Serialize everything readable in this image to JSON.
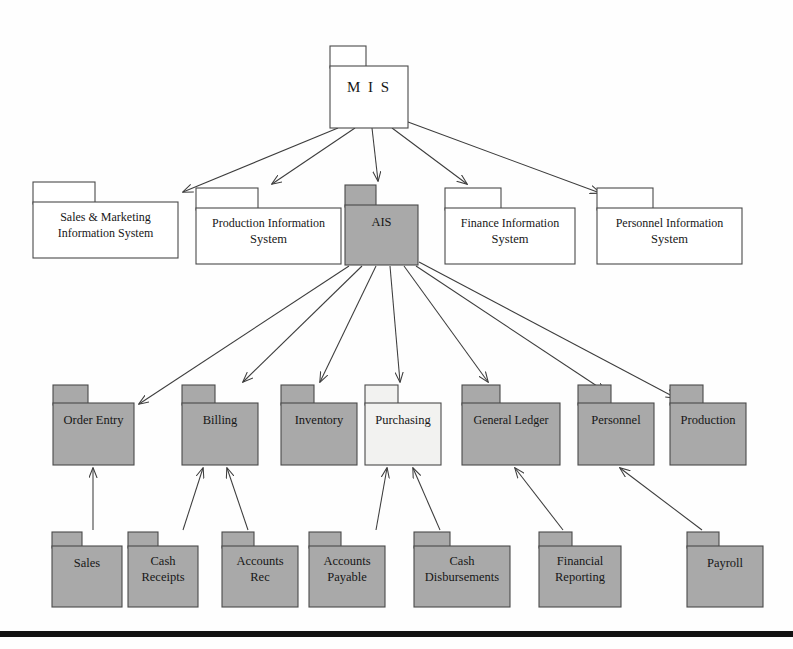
{
  "diagram": {
    "colors": {
      "shaded_fill": "#a9a9a9",
      "light_fill": "#f2f2f0",
      "white_fill": "#ffffff",
      "outline": "#4a4a4a",
      "connector": "#3c3c3c",
      "rule": "#121212",
      "text": "#171717"
    },
    "levels": [
      {
        "id": "level-1",
        "name": "root",
        "nodes": [
          {
            "id": "mis",
            "label": "M I S",
            "lines": [
              "M I S"
            ],
            "fill": "white_fill",
            "x": 330,
            "y": 46,
            "w": 78,
            "h": 82,
            "tab_w": 36,
            "tab_h": 20
          }
        ]
      },
      {
        "id": "level-2",
        "name": "information-systems",
        "nodes": [
          {
            "id": "sales-marketing-is",
            "label": "Sales & Marketing Information System",
            "lines": [
              "Sales & Marketing",
              "Information System"
            ],
            "fill": "white_fill",
            "x": 33,
            "y": 182,
            "w": 145,
            "h": 76,
            "tab_w": 62,
            "tab_h": 20
          },
          {
            "id": "production-is",
            "label": "Production Information System",
            "lines": [
              "Production Information",
              "System"
            ],
            "fill": "white_fill",
            "x": 196,
            "y": 188,
            "w": 145,
            "h": 76,
            "tab_w": 62,
            "tab_h": 20
          },
          {
            "id": "ais",
            "label": "AIS",
            "lines": [
              "AIS"
            ],
            "fill": "shaded_fill",
            "x": 345,
            "y": 185,
            "w": 73,
            "h": 80,
            "tab_w": 31,
            "tab_h": 20
          },
          {
            "id": "finance-is",
            "label": "Finance Information System",
            "lines": [
              "Finance Information",
              "System"
            ],
            "fill": "white_fill",
            "x": 445,
            "y": 188,
            "w": 130,
            "h": 76,
            "tab_w": 56,
            "tab_h": 20
          },
          {
            "id": "personnel-is",
            "label": "Personnel Information System",
            "lines": [
              "Personnel Information",
              "System"
            ],
            "fill": "white_fill",
            "x": 597,
            "y": 188,
            "w": 145,
            "h": 76,
            "tab_w": 56,
            "tab_h": 20
          }
        ]
      },
      {
        "id": "level-3",
        "name": "ais-subsystems",
        "nodes": [
          {
            "id": "order-entry",
            "label": "Order Entry",
            "lines": [
              "Order Entry"
            ],
            "fill": "shaded_fill",
            "x": 53,
            "y": 385,
            "w": 81,
            "h": 80,
            "tab_w": 35,
            "tab_h": 18
          },
          {
            "id": "billing",
            "label": "Billing",
            "lines": [
              "Billing"
            ],
            "fill": "shaded_fill",
            "x": 182,
            "y": 385,
            "w": 76,
            "h": 80,
            "tab_w": 33,
            "tab_h": 18
          },
          {
            "id": "inventory",
            "label": "Inventory",
            "lines": [
              "Inventory"
            ],
            "fill": "shaded_fill",
            "x": 281,
            "y": 385,
            "w": 76,
            "h": 80,
            "tab_w": 33,
            "tab_h": 18
          },
          {
            "id": "purchasing",
            "label": "Purchasing",
            "lines": [
              "Purchasing"
            ],
            "fill": "light_fill",
            "x": 365,
            "y": 385,
            "w": 76,
            "h": 80,
            "tab_w": 33,
            "tab_h": 18
          },
          {
            "id": "general-ledger",
            "label": "General Ledger",
            "lines": [
              "General Ledger"
            ],
            "fill": "shaded_fill",
            "x": 462,
            "y": 385,
            "w": 98,
            "h": 80,
            "tab_w": 38,
            "tab_h": 18
          },
          {
            "id": "personnel",
            "label": "Personnel",
            "lines": [
              "Personnel"
            ],
            "fill": "shaded_fill",
            "x": 578,
            "y": 385,
            "w": 76,
            "h": 80,
            "tab_w": 33,
            "tab_h": 18
          },
          {
            "id": "production",
            "label": "Production",
            "lines": [
              "Production"
            ],
            "fill": "shaded_fill",
            "x": 670,
            "y": 385,
            "w": 76,
            "h": 80,
            "tab_w": 33,
            "tab_h": 18
          }
        ]
      },
      {
        "id": "level-4",
        "name": "transaction-cycles",
        "nodes": [
          {
            "id": "sales",
            "label": "Sales",
            "lines": [
              "Sales"
            ],
            "fill": "shaded_fill",
            "x": 52,
            "y": 532,
            "w": 70,
            "h": 75,
            "tab_w": 30,
            "tab_h": 14
          },
          {
            "id": "cash-receipts",
            "label": "Cash Receipts",
            "lines": [
              "Cash",
              "Receipts"
            ],
            "fill": "shaded_fill",
            "x": 128,
            "y": 532,
            "w": 70,
            "h": 75,
            "tab_w": 30,
            "tab_h": 14
          },
          {
            "id": "accounts-rec",
            "label": "Accounts Rec",
            "lines": [
              "Accounts",
              "Rec"
            ],
            "fill": "shaded_fill",
            "x": 222,
            "y": 532,
            "w": 76,
            "h": 75,
            "tab_w": 32,
            "tab_h": 14
          },
          {
            "id": "accounts-payable",
            "label": "Accounts Payable",
            "lines": [
              "Accounts",
              "Payable"
            ],
            "fill": "shaded_fill",
            "x": 309,
            "y": 532,
            "w": 76,
            "h": 75,
            "tab_w": 32,
            "tab_h": 14
          },
          {
            "id": "cash-disbursements",
            "label": "Cash Disbursements",
            "lines": [
              "Cash",
              "Disbursements"
            ],
            "fill": "shaded_fill",
            "x": 414,
            "y": 532,
            "w": 96,
            "h": 75,
            "tab_w": 36,
            "tab_h": 14
          },
          {
            "id": "financial-reporting",
            "label": "Financial Reporting",
            "lines": [
              "Financial",
              "Reporting"
            ],
            "fill": "shaded_fill",
            "x": 539,
            "y": 532,
            "w": 82,
            "h": 75,
            "tab_w": 33,
            "tab_h": 14
          },
          {
            "id": "payroll",
            "label": "Payroll",
            "lines": [
              "Payroll"
            ],
            "fill": "shaded_fill",
            "x": 687,
            "y": 532,
            "w": 76,
            "h": 75,
            "tab_w": 32,
            "tab_h": 14
          }
        ]
      }
    ],
    "connectors": [
      {
        "id": "mis-to-sales-marketing-is",
        "from": "mis",
        "to": "sales-marketing-is",
        "x1": 338,
        "y1": 128,
        "x2": 183,
        "y2": 192
      },
      {
        "id": "mis-to-production-is",
        "from": "mis",
        "to": "production-is",
        "x1": 355,
        "y1": 128,
        "x2": 272,
        "y2": 184
      },
      {
        "id": "mis-to-ais",
        "from": "mis",
        "to": "ais",
        "x1": 372,
        "y1": 128,
        "x2": 378,
        "y2": 181
      },
      {
        "id": "mis-to-finance-is",
        "from": "mis",
        "to": "finance-is",
        "x1": 392,
        "y1": 128,
        "x2": 467,
        "y2": 184
      },
      {
        "id": "mis-to-personnel-is",
        "from": "mis",
        "to": "personnel-is",
        "x1": 408,
        "y1": 122,
        "x2": 600,
        "y2": 193
      },
      {
        "id": "ais-to-order-entry",
        "from": "ais",
        "to": "order-entry",
        "x1": 349,
        "y1": 266,
        "x2": 139,
        "y2": 404
      },
      {
        "id": "ais-to-billing",
        "from": "ais",
        "to": "billing",
        "x1": 362,
        "y1": 266,
        "x2": 243,
        "y2": 382
      },
      {
        "id": "ais-to-inventory",
        "from": "ais",
        "to": "inventory",
        "x1": 376,
        "y1": 266,
        "x2": 320,
        "y2": 382
      },
      {
        "id": "ais-to-purchasing",
        "from": "ais",
        "to": "purchasing",
        "x1": 390,
        "y1": 266,
        "x2": 400,
        "y2": 382
      },
      {
        "id": "ais-to-general-ledger",
        "from": "ais",
        "to": "general-ledger",
        "x1": 404,
        "y1": 266,
        "x2": 488,
        "y2": 382
      },
      {
        "id": "ais-to-personnel",
        "from": "ais",
        "to": "personnel",
        "x1": 416,
        "y1": 266,
        "x2": 606,
        "y2": 392
      },
      {
        "id": "ais-to-production",
        "from": "ais",
        "to": "production",
        "x1": 419,
        "y1": 262,
        "x2": 676,
        "y2": 398
      },
      {
        "id": "sales-to-order-entry",
        "from": "sales",
        "to": "order-entry",
        "x1": 93,
        "y1": 530,
        "x2": 93,
        "y2": 468
      },
      {
        "id": "cash-receipts-to-billing",
        "from": "cash-receipts",
        "to": "billing",
        "x1": 183,
        "y1": 530,
        "x2": 203,
        "y2": 468
      },
      {
        "id": "accounts-rec-to-billing",
        "from": "accounts-rec",
        "to": "billing",
        "x1": 248,
        "y1": 530,
        "x2": 227,
        "y2": 468
      },
      {
        "id": "accounts-payable-to-purchasing",
        "from": "accounts-payable",
        "to": "purchasing",
        "x1": 376,
        "y1": 530,
        "x2": 387,
        "y2": 468
      },
      {
        "id": "cash-disbursements-to-purchasing",
        "from": "cash-disbursements",
        "to": "purchasing",
        "x1": 440,
        "y1": 530,
        "x2": 413,
        "y2": 468
      },
      {
        "id": "financial-reporting-to-general-ledger",
        "from": "financial-reporting",
        "to": "general-ledger",
        "x1": 563,
        "y1": 530,
        "x2": 515,
        "y2": 468
      },
      {
        "id": "payroll-to-personnel",
        "from": "payroll",
        "to": "personnel",
        "x1": 702,
        "y1": 530,
        "x2": 620,
        "y2": 468
      }
    ],
    "baseline_rule": {
      "id": "bottom-rule",
      "x": 0,
      "y": 631,
      "w": 793,
      "h": 6
    }
  }
}
